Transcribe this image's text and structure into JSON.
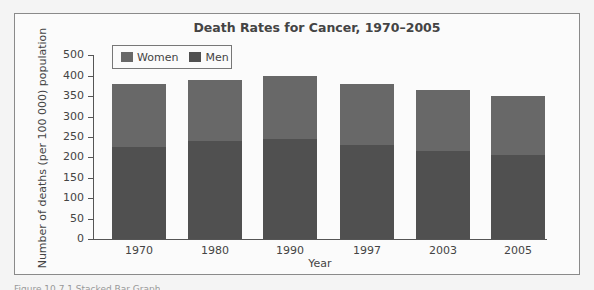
{
  "chart_data": {
    "type": "bar",
    "stacked": true,
    "title": "Death Rates for Cancer, 1970–2005",
    "xlabel": "Year",
    "ylabel": "Number of deaths (per 100 000) population",
    "categories": [
      "1970",
      "1980",
      "1990",
      "1997",
      "2003",
      "2005"
    ],
    "series": [
      {
        "name": "Men",
        "color": "#505050",
        "values": [
          225,
          240,
          245,
          230,
          215,
          205
        ]
      },
      {
        "name": "Women",
        "color": "#686868",
        "values": [
          155,
          150,
          155,
          150,
          150,
          145
        ]
      }
    ],
    "totals": [
      380,
      390,
      400,
      380,
      365,
      350
    ],
    "yticks": [
      "0",
      "50",
      "100",
      "150",
      "200",
      "250",
      "300",
      "350",
      "400",
      "500"
    ],
    "ylim": [
      0,
      500
    ],
    "grid": false,
    "legend_position": "top-left inside",
    "legend": [
      "Women",
      "Men"
    ]
  },
  "caption": "Figure 10.7.1 Stacked Bar Graph"
}
